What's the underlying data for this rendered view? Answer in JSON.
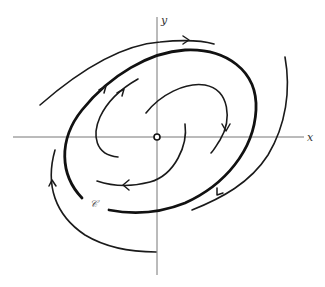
{
  "figure": {
    "type": "phase-portrait",
    "axes": {
      "x_label": "x",
      "y_label": "y"
    },
    "origin_marker": "open-circle",
    "limit_cycle_label": "𝒞",
    "colors": {
      "background": "#ffffff",
      "axis": "#777777",
      "trajectory": "#1a1a1a"
    },
    "trajectories": [
      {
        "id": "outer-top",
        "direction": "clockwise",
        "style": "thin"
      },
      {
        "id": "outer-right",
        "direction": "clockwise",
        "style": "thin"
      },
      {
        "id": "outer-left-bottom",
        "direction": "clockwise",
        "style": "thin"
      },
      {
        "id": "limit-cycle",
        "direction": "clockwise",
        "style": "thick"
      },
      {
        "id": "inner-upper",
        "direction": "clockwise",
        "style": "thin"
      },
      {
        "id": "inner-right",
        "direction": "clockwise",
        "style": "thin"
      },
      {
        "id": "inner-lower",
        "direction": "clockwise",
        "style": "thin"
      },
      {
        "id": "inner-left",
        "direction": "clockwise",
        "style": "thin"
      }
    ]
  }
}
